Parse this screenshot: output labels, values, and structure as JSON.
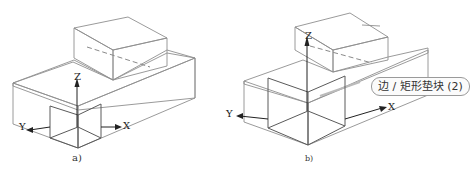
{
  "figures": [
    {
      "id": "a",
      "caption": "a)",
      "axes": {
        "x": "X",
        "y": "Y",
        "z": "Z"
      }
    },
    {
      "id": "b",
      "caption": "b)",
      "axes": {
        "x": "X",
        "y": "Y",
        "z": "Z"
      },
      "tooltip": "边 / 矩形垫块 (2)"
    }
  ],
  "colors": {
    "top_face": "#ededed",
    "front_face": "#dcdcdc",
    "side_face": "#e4e4e4",
    "edge": "#8e8e8e",
    "axis": "#222222"
  }
}
